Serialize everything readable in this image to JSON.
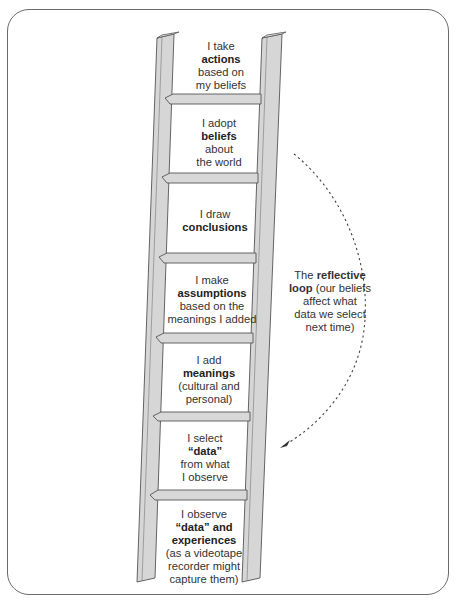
{
  "steps": [
    {
      "level": 7,
      "pre": "I take",
      "bold": "actions",
      "post": [
        "based on",
        "my beliefs"
      ]
    },
    {
      "level": 6,
      "pre": "I adopt",
      "bold": "beliefs",
      "post": [
        "about",
        "the world"
      ]
    },
    {
      "level": 5,
      "pre": "I draw",
      "bold": "conclusions",
      "post": []
    },
    {
      "level": 4,
      "pre": "I make",
      "bold": "assumptions",
      "post": [
        "based on the",
        "meanings I added"
      ]
    },
    {
      "level": 3,
      "pre": "I add",
      "bold": "meanings",
      "post": [
        "(cultural and",
        "personal)"
      ]
    },
    {
      "level": 2,
      "pre": "I select",
      "bold": "“data”",
      "post": [
        "from what",
        "I observe"
      ]
    },
    {
      "level": 1,
      "pre": "I observe",
      "bold": "“data” and",
      "bold2": "experiences",
      "post": [
        "(as a videotape",
        "recorder might",
        "capture them)"
      ]
    }
  ],
  "loop": {
    "pre": "The",
    "bold": "reflective",
    "bold2": "loop",
    "post": "(our beliefs affect what data we select next time)",
    "line1_tail": "(our beliefs",
    "line2": "affect what",
    "line3": "data we select",
    "line4": "next time)"
  },
  "colors": {
    "rail_fill": "#d4d4d4",
    "rail_stroke": "#5a5a5a",
    "frame": "#6a6a6a",
    "text": "#333333"
  }
}
